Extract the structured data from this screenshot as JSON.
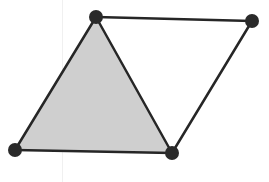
{
  "diagram": {
    "colors": {
      "fill": "#cfcfcf",
      "stroke": "#262626",
      "vertex": "#2a2a2a",
      "background": "#ffffff"
    },
    "vertices": [
      {
        "id": "top",
        "x": 96,
        "y": 17
      },
      {
        "id": "top-right",
        "x": 252,
        "y": 21
      },
      {
        "id": "bottom-left",
        "x": 15,
        "y": 150
      },
      {
        "id": "bottom-right",
        "x": 172,
        "y": 153
      }
    ],
    "edges": [
      [
        "top",
        "top-right"
      ],
      [
        "top-right",
        "bottom-right"
      ],
      [
        "bottom-right",
        "bottom-left"
      ],
      [
        "bottom-left",
        "top"
      ],
      [
        "top",
        "bottom-right"
      ]
    ],
    "shaded_triangle": [
      "top",
      "bottom-left",
      "bottom-right"
    ]
  }
}
